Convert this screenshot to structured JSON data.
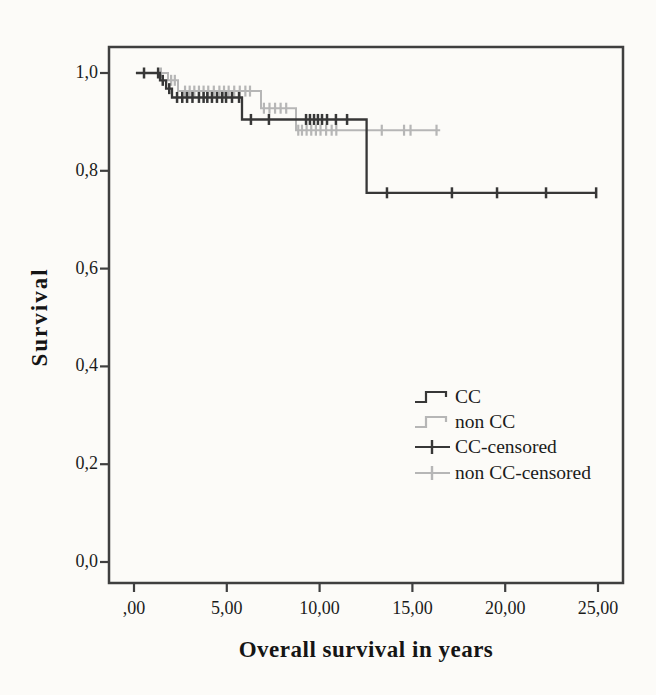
{
  "figure": {
    "background": "#fcfbf8",
    "frame_color": "#3f3f3f",
    "text_color": "#1b1b1b"
  },
  "chart_data": {
    "type": "line",
    "subtype": "kaplan-meier-step-survival",
    "title": "",
    "xlabel": "Overall survival in years",
    "ylabel": "Survival",
    "grid": false,
    "legend_position": "inside-right",
    "xlim": [
      -1.35,
      26.35
    ],
    "ylim": [
      -0.04,
      1.05
    ],
    "x_ticks": {
      "values": [
        0,
        5,
        10,
        15,
        20,
        25
      ],
      "labels": [
        ",00",
        "5,00",
        "10,00",
        "15,00",
        "20,00",
        "25,00"
      ]
    },
    "y_ticks": {
      "values": [
        0,
        0.2,
        0.4,
        0.6,
        0.8,
        1
      ],
      "labels": [
        "0,0",
        "0,2",
        "0,4",
        "0,6",
        "0,8",
        "1,0"
      ]
    },
    "series": [
      {
        "name": "non CC",
        "color": "#b6b6b6",
        "line_width": 2,
        "steps": [
          [
            1.24,
            1.0
          ],
          [
            1.83,
            0.985
          ],
          [
            2.37,
            0.963
          ],
          [
            6.84,
            0.928
          ],
          [
            8.73,
            0.883
          ],
          [
            16.5,
            0.883
          ]
        ],
        "censored": [
          [
            1.45,
            1.0
          ],
          [
            2.0,
            0.985
          ],
          [
            2.2,
            0.985
          ],
          [
            2.75,
            0.963
          ],
          [
            3.0,
            0.963
          ],
          [
            3.25,
            0.963
          ],
          [
            3.5,
            0.963
          ],
          [
            3.75,
            0.963
          ],
          [
            4.0,
            0.963
          ],
          [
            4.3,
            0.963
          ],
          [
            4.6,
            0.963
          ],
          [
            4.85,
            0.963
          ],
          [
            5.1,
            0.963
          ],
          [
            5.4,
            0.963
          ],
          [
            5.7,
            0.963
          ],
          [
            6.0,
            0.963
          ],
          [
            6.25,
            0.963
          ],
          [
            7.0,
            0.928
          ],
          [
            7.3,
            0.928
          ],
          [
            7.6,
            0.928
          ],
          [
            7.9,
            0.928
          ],
          [
            8.2,
            0.928
          ],
          [
            8.85,
            0.883
          ],
          [
            9.05,
            0.883
          ],
          [
            9.3,
            0.883
          ],
          [
            9.55,
            0.883
          ],
          [
            9.8,
            0.883
          ],
          [
            10.05,
            0.883
          ],
          [
            10.35,
            0.883
          ],
          [
            10.65,
            0.883
          ],
          [
            10.9,
            0.883
          ],
          [
            13.35,
            0.883
          ],
          [
            14.55,
            0.883
          ],
          [
            14.9,
            0.883
          ],
          [
            16.3,
            0.883
          ]
        ]
      },
      {
        "name": "CC",
        "color": "#373737",
        "line_width": 2.3,
        "steps": [
          [
            0.1,
            1.0
          ],
          [
            1.4,
            0.985
          ],
          [
            1.73,
            0.968
          ],
          [
            2.05,
            0.95
          ],
          [
            5.82,
            0.905
          ],
          [
            12.53,
            0.755
          ],
          [
            24.9,
            0.755
          ]
        ],
        "censored": [
          [
            0.54,
            1.0
          ],
          [
            1.3,
            1.0
          ],
          [
            1.55,
            0.985
          ],
          [
            1.9,
            0.968
          ],
          [
            2.32,
            0.95
          ],
          [
            2.6,
            0.95
          ],
          [
            2.86,
            0.95
          ],
          [
            3.15,
            0.95
          ],
          [
            3.5,
            0.95
          ],
          [
            3.75,
            0.95
          ],
          [
            3.95,
            0.95
          ],
          [
            4.2,
            0.95
          ],
          [
            4.47,
            0.95
          ],
          [
            4.75,
            0.95
          ],
          [
            4.96,
            0.95
          ],
          [
            5.28,
            0.95
          ],
          [
            5.66,
            0.95
          ],
          [
            6.3,
            0.905
          ],
          [
            7.27,
            0.905
          ],
          [
            9.27,
            0.905
          ],
          [
            9.48,
            0.905
          ],
          [
            9.7,
            0.905
          ],
          [
            9.91,
            0.905
          ],
          [
            10.13,
            0.905
          ],
          [
            10.4,
            0.905
          ],
          [
            10.88,
            0.905
          ],
          [
            11.48,
            0.905
          ],
          [
            13.63,
            0.755
          ],
          [
            17.13,
            0.755
          ],
          [
            19.56,
            0.755
          ],
          [
            22.2,
            0.755
          ],
          [
            24.9,
            0.755
          ]
        ]
      }
    ],
    "legend": {
      "entries": [
        {
          "label": "CC",
          "symbol": "step-line",
          "color": "#373737"
        },
        {
          "label": "non CC",
          "symbol": "step-line",
          "color": "#b6b6b6"
        },
        {
          "label": "CC-censored",
          "symbol": "censor-mark",
          "color": "#373737"
        },
        {
          "label": "non CC-censored",
          "symbol": "censor-mark",
          "color": "#b6b6b6"
        }
      ]
    }
  }
}
